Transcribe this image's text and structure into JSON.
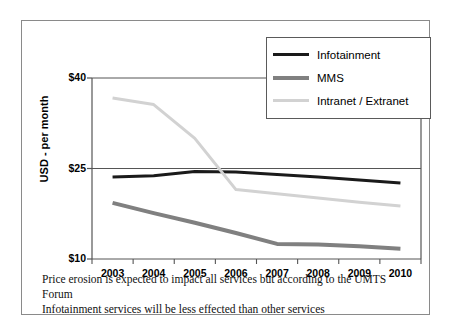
{
  "figure": {
    "y_axis_title": "USD - per month",
    "caption_line_1": "Price erosion is expected to impact all services but according to the UMTS Forum",
    "caption_line_2": "Infotainment services will be less effected than other services"
  },
  "legend": {
    "position": "top-right",
    "items": [
      {
        "label": "Infotainment",
        "color": "#1a1a1a",
        "width": 3
      },
      {
        "label": "MMS",
        "color": "#808080",
        "width": 4
      },
      {
        "label": "Intranet / Extranet",
        "color": "#d2d2d2",
        "width": 3
      }
    ]
  },
  "axes": {
    "y_ticks": [
      "$40",
      "$25",
      "$10"
    ],
    "y_tick_values": [
      40,
      25,
      10
    ],
    "x_ticks": [
      "2003",
      "2004",
      "2005",
      "2006",
      "2007",
      "2008",
      "2009",
      "2010"
    ]
  },
  "chart_data": {
    "type": "line",
    "title": "",
    "subtitle": "",
    "xlabel": "",
    "ylabel": "USD - per month",
    "categories": [
      "2003",
      "2004",
      "2005",
      "2006",
      "2007",
      "2008",
      "2009",
      "2010"
    ],
    "ylim": [
      10,
      40
    ],
    "yticks": [
      10,
      25,
      40
    ],
    "ytick_labels": [
      "$10",
      "$25",
      "$40"
    ],
    "grid": "horizontal-at-yticks",
    "legend_position": "top-right",
    "series": [
      {
        "name": "Infotainment",
        "color": "#1a1a1a",
        "values": [
          23.6,
          23.8,
          24.5,
          24.4,
          24.0,
          23.6,
          23.1,
          22.6
        ]
      },
      {
        "name": "MMS",
        "color": "#808080",
        "values": [
          19.3,
          17.6,
          16.0,
          14.3,
          12.5,
          12.4,
          12.1,
          11.7
        ]
      },
      {
        "name": "Intranet / Extranet",
        "color": "#d2d2d2",
        "values": [
          36.7,
          35.6,
          30.0,
          21.5,
          20.8,
          20.1,
          19.4,
          18.8
        ]
      }
    ],
    "annotations": [
      "Infotainment and Intranet / Extranet lines cross between 2005 and 2006"
    ]
  }
}
